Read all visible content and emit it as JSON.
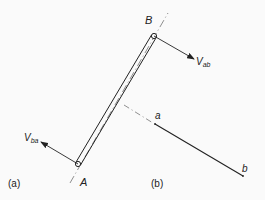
{
  "figure": {
    "panel_a_label": "(a)",
    "panel_b_label": "(b)"
  },
  "bar": {
    "end_a_label": "A",
    "end_b_label": "B",
    "velocity_ab": {
      "main": "V",
      "sub": "ab"
    },
    "velocity_ba": {
      "main": "V",
      "sub": "ba"
    }
  },
  "velocity_diagram": {
    "point_a_label": "a",
    "point_b_label": "b"
  },
  "colors": {
    "line": "#222222",
    "background": "#fafafa"
  }
}
